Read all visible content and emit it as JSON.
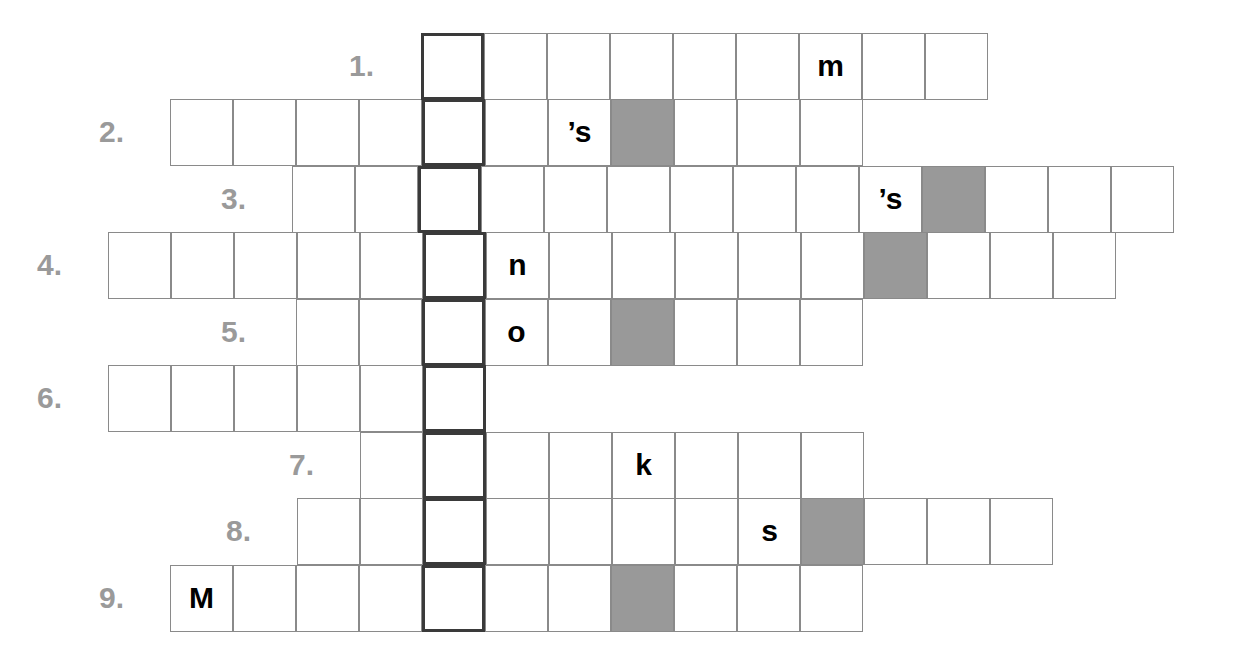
{
  "puzzle": {
    "title": "Crossword puzzle grid",
    "cell_width": 63,
    "cell_height": 66.5,
    "key_column_x": 421,
    "key_column_border_color": "#3a3a3a",
    "grid_line_color": "#8a8a8a",
    "shaded_cell_color": "#999999",
    "clue_number_color": "#9a9a9a",
    "letter_color": "#000000",
    "background_color": "#ffffff",
    "rows": [
      {
        "number": "1.",
        "number_x": 374,
        "y": 33,
        "start_x": 421,
        "cells": [
          {
            "letter": "",
            "shaded": false,
            "key": true
          },
          {
            "letter": "",
            "shaded": false,
            "key": false
          },
          {
            "letter": "",
            "shaded": false,
            "key": false
          },
          {
            "letter": "",
            "shaded": false,
            "key": false
          },
          {
            "letter": "",
            "shaded": false,
            "key": false
          },
          {
            "letter": "",
            "shaded": false,
            "key": false
          },
          {
            "letter": "m",
            "shaded": false,
            "key": false
          },
          {
            "letter": "",
            "shaded": false,
            "key": false
          },
          {
            "letter": "",
            "shaded": false,
            "key": false
          }
        ]
      },
      {
        "number": "2.",
        "number_x": 124,
        "y": 99,
        "start_x": 170,
        "cells": [
          {
            "letter": "",
            "shaded": false,
            "key": false
          },
          {
            "letter": "",
            "shaded": false,
            "key": false
          },
          {
            "letter": "",
            "shaded": false,
            "key": false
          },
          {
            "letter": "",
            "shaded": false,
            "key": false
          },
          {
            "letter": "",
            "shaded": false,
            "key": true
          },
          {
            "letter": "",
            "shaded": false,
            "key": false
          },
          {
            "letter": "’s",
            "shaded": false,
            "key": false
          },
          {
            "letter": "",
            "shaded": true,
            "key": false
          },
          {
            "letter": "",
            "shaded": false,
            "key": false
          },
          {
            "letter": "",
            "shaded": false,
            "key": false
          },
          {
            "letter": "",
            "shaded": false,
            "key": false
          }
        ]
      },
      {
        "number": "3.",
        "number_x": 246,
        "y": 166,
        "start_x": 292,
        "cells": [
          {
            "letter": "",
            "shaded": false,
            "key": false
          },
          {
            "letter": "",
            "shaded": false,
            "key": false
          },
          {
            "letter": "",
            "shaded": false,
            "key": true
          },
          {
            "letter": "",
            "shaded": false,
            "key": false
          },
          {
            "letter": "",
            "shaded": false,
            "key": false
          },
          {
            "letter": "",
            "shaded": false,
            "key": false
          },
          {
            "letter": "",
            "shaded": false,
            "key": false
          },
          {
            "letter": "",
            "shaded": false,
            "key": false
          },
          {
            "letter": "",
            "shaded": false,
            "key": false
          },
          {
            "letter": "’s",
            "shaded": false,
            "key": false
          },
          {
            "letter": "",
            "shaded": true,
            "key": false
          },
          {
            "letter": "",
            "shaded": false,
            "key": false
          },
          {
            "letter": "",
            "shaded": false,
            "key": false
          },
          {
            "letter": "",
            "shaded": false,
            "key": false
          }
        ]
      },
      {
        "number": "4.",
        "number_x": 62,
        "y": 232,
        "start_x": 108,
        "cells": [
          {
            "letter": "",
            "shaded": false,
            "key": false
          },
          {
            "letter": "",
            "shaded": false,
            "key": false
          },
          {
            "letter": "",
            "shaded": false,
            "key": false
          },
          {
            "letter": "",
            "shaded": false,
            "key": false
          },
          {
            "letter": "",
            "shaded": false,
            "key": false
          },
          {
            "letter": "",
            "shaded": false,
            "key": true
          },
          {
            "letter": "n",
            "shaded": false,
            "key": false
          },
          {
            "letter": "",
            "shaded": false,
            "key": false
          },
          {
            "letter": "",
            "shaded": false,
            "key": false
          },
          {
            "letter": "",
            "shaded": false,
            "key": false
          },
          {
            "letter": "",
            "shaded": false,
            "key": false
          },
          {
            "letter": "",
            "shaded": false,
            "key": false
          },
          {
            "letter": "",
            "shaded": true,
            "key": false
          },
          {
            "letter": "",
            "shaded": false,
            "key": false
          },
          {
            "letter": "",
            "shaded": false,
            "key": false
          },
          {
            "letter": "",
            "shaded": false,
            "key": false
          }
        ]
      },
      {
        "number": "5.",
        "number_x": 246,
        "y": 299,
        "start_x": 296,
        "cells": [
          {
            "letter": "",
            "shaded": false,
            "key": false
          },
          {
            "letter": "",
            "shaded": false,
            "key": false
          },
          {
            "letter": "",
            "shaded": false,
            "key": true
          },
          {
            "letter": "o",
            "shaded": false,
            "key": false
          },
          {
            "letter": "",
            "shaded": false,
            "key": false
          },
          {
            "letter": "",
            "shaded": true,
            "key": false
          },
          {
            "letter": "",
            "shaded": false,
            "key": false
          },
          {
            "letter": "",
            "shaded": false,
            "key": false
          },
          {
            "letter": "",
            "shaded": false,
            "key": false
          }
        ]
      },
      {
        "number": "6.",
        "number_x": 62,
        "y": 365,
        "start_x": 108,
        "cells": [
          {
            "letter": "",
            "shaded": false,
            "key": false
          },
          {
            "letter": "",
            "shaded": false,
            "key": false
          },
          {
            "letter": "",
            "shaded": false,
            "key": false
          },
          {
            "letter": "",
            "shaded": false,
            "key": false
          },
          {
            "letter": "",
            "shaded": false,
            "key": false
          },
          {
            "letter": "",
            "shaded": false,
            "key": true
          }
        ]
      },
      {
        "number": "7.",
        "number_x": 314,
        "y": 432,
        "start_x": 360,
        "cells": [
          {
            "letter": "",
            "shaded": false,
            "key": false
          },
          {
            "letter": "",
            "shaded": false,
            "key": true
          },
          {
            "letter": "",
            "shaded": false,
            "key": false
          },
          {
            "letter": "",
            "shaded": false,
            "key": false
          },
          {
            "letter": "k",
            "shaded": false,
            "key": false
          },
          {
            "letter": "",
            "shaded": false,
            "key": false
          },
          {
            "letter": "",
            "shaded": false,
            "key": false
          },
          {
            "letter": "",
            "shaded": false,
            "key": false
          }
        ]
      },
      {
        "number": "8.",
        "number_x": 251,
        "y": 498,
        "start_x": 297,
        "cells": [
          {
            "letter": "",
            "shaded": false,
            "key": false
          },
          {
            "letter": "",
            "shaded": false,
            "key": false
          },
          {
            "letter": "",
            "shaded": false,
            "key": true
          },
          {
            "letter": "",
            "shaded": false,
            "key": false
          },
          {
            "letter": "",
            "shaded": false,
            "key": false
          },
          {
            "letter": "",
            "shaded": false,
            "key": false
          },
          {
            "letter": "",
            "shaded": false,
            "key": false
          },
          {
            "letter": "s",
            "shaded": false,
            "key": false
          },
          {
            "letter": "",
            "shaded": true,
            "key": false
          },
          {
            "letter": "",
            "shaded": false,
            "key": false
          },
          {
            "letter": "",
            "shaded": false,
            "key": false
          },
          {
            "letter": "",
            "shaded": false,
            "key": false
          }
        ]
      },
      {
        "number": "9.",
        "number_x": 124,
        "y": 565,
        "start_x": 170,
        "cells": [
          {
            "letter": "M",
            "shaded": false,
            "key": false
          },
          {
            "letter": "",
            "shaded": false,
            "key": false
          },
          {
            "letter": "",
            "shaded": false,
            "key": false
          },
          {
            "letter": "",
            "shaded": false,
            "key": false
          },
          {
            "letter": "",
            "shaded": false,
            "key": true
          },
          {
            "letter": "",
            "shaded": false,
            "key": false
          },
          {
            "letter": "",
            "shaded": false,
            "key": false
          },
          {
            "letter": "",
            "shaded": true,
            "key": false
          },
          {
            "letter": "",
            "shaded": false,
            "key": false
          },
          {
            "letter": "",
            "shaded": false,
            "key": false
          },
          {
            "letter": "",
            "shaded": false,
            "key": false
          }
        ]
      }
    ]
  }
}
